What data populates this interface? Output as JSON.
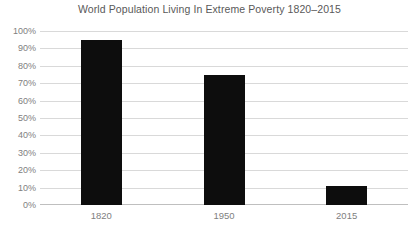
{
  "chart_data": {
    "type": "bar",
    "title": "World Population Living In Extreme Poverty 1820–2015",
    "xlabel": "",
    "ylabel": "",
    "categories": [
      "1820",
      "1950",
      "2015"
    ],
    "values": [
      95,
      75,
      11
    ],
    "ylim": [
      0,
      100
    ],
    "ytick_labels": [
      "100%",
      "90%",
      "80%",
      "70%",
      "60%",
      "50%",
      "40%",
      "30%",
      "20%",
      "10%",
      "0%"
    ],
    "ytick_values": [
      100,
      90,
      80,
      70,
      60,
      50,
      40,
      30,
      20,
      10,
      0
    ],
    "grid": true,
    "legend": "none",
    "bar_color": "#0d0d0d",
    "grid_color": "#d9d9d9",
    "axis_color": "#bfbfbf",
    "text_color": "#808080",
    "title_color": "#595959",
    "background_color": "#ffffff"
  }
}
